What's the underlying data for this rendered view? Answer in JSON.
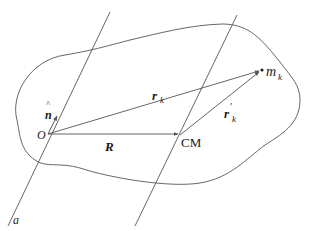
{
  "diagram": {
    "type": "rigid-body-vectors",
    "colors": {
      "stroke": "#555555",
      "text": "#1a1a1a",
      "background": "#ffffff"
    },
    "labels": {
      "origin": "O",
      "normal_vec": "n",
      "normal_hat": "^",
      "axis": "a",
      "r_k_main": "r",
      "r_k_sub": "k",
      "R": "R",
      "cm": "CM",
      "rprime_main": "r",
      "rprime_prime": "′",
      "rprime_sub": "k",
      "mass_main": "m",
      "mass_sub": "k"
    },
    "points": {
      "O": [
        48,
        134
      ],
      "CM": [
        180,
        135
      ],
      "m_k": [
        262,
        70
      ]
    },
    "vectors": [
      {
        "name": "r_k",
        "from": "O",
        "to": "m_k"
      },
      {
        "name": "R",
        "from": "O",
        "to": "CM"
      },
      {
        "name": "r'_k",
        "from": "CM",
        "to": "m_k"
      },
      {
        "name": "n_hat",
        "from": "O",
        "direction": "along axis a"
      }
    ],
    "lines": [
      {
        "name": "axis-a",
        "from": [
          110,
          12
        ],
        "to": [
          8,
          226
        ]
      },
      {
        "name": "parallel-axis-through-CM",
        "from": [
          237,
          15
        ],
        "to": [
          135,
          226
        ]
      }
    ]
  }
}
